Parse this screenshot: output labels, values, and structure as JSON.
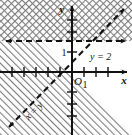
{
  "figure": {
    "background_color": "#ffffff",
    "ink_color": "#111111",
    "width": 132,
    "height": 135
  },
  "axes": {
    "x_axis_label": "x",
    "y_axis_label": "y",
    "origin_label": "O",
    "x_tick_label": "1",
    "y_tick_label": "1",
    "origin_px": {
      "x": 72,
      "y": 72
    },
    "unit_px": 12,
    "x_axis_arrow": "arrow-right",
    "y_axis_arrow": "arrow-up",
    "x_ticks": [
      -6,
      -5,
      -4,
      -3,
      -2,
      -1,
      1,
      2,
      3,
      4
    ],
    "y_ticks": [
      -5,
      -4,
      -3,
      -2,
      -1,
      1,
      2,
      3,
      4,
      5
    ]
  },
  "lines": [
    {
      "id": "horizontal-line",
      "label": "y = 2",
      "equation": "y = 2",
      "style": "dashed",
      "arrows": "both",
      "label_px": {
        "x": 90,
        "y": 56
      }
    },
    {
      "id": "diagonal-line",
      "label": "x = y",
      "equation": "x = y",
      "style": "dashed",
      "arrows": "both",
      "slope": 1,
      "rotation_deg": -45,
      "label_px": {
        "x": 36,
        "y": 113
      }
    }
  ],
  "regions": [
    {
      "id": "cross-hatched-region",
      "description": "region above the line y = 2",
      "pattern": "cross-hatch"
    },
    {
      "id": "hatched-region",
      "description": "region below y = 2 and left of x = y",
      "pattern": "diagonal-hatch"
    }
  ]
}
